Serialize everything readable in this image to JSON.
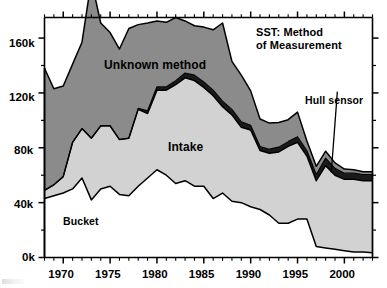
{
  "chart_data": {
    "type": "area",
    "stacked": true,
    "title_lines": [
      "SST: Method",
      "of Measurement"
    ],
    "xlabel": "",
    "ylabel": "",
    "xlim": [
      1968,
      2003
    ],
    "ylim": [
      0,
      175000
    ],
    "ytick_values": [
      0,
      40000,
      80000,
      120000,
      160000
    ],
    "ytick_labels": [
      "0k",
      "40k",
      "80k",
      "120k",
      "160k"
    ],
    "yminor_step": 20000,
    "xtick_values": [
      1970,
      1975,
      1980,
      1985,
      1990,
      1995,
      2000
    ],
    "xtick_labels": [
      "1970",
      "1975",
      "1980",
      "1985",
      "1990",
      "1995",
      "2000"
    ],
    "xminor_step": 1,
    "grid": false,
    "legend_position": "inline-annotations",
    "annotations": [
      {
        "text": "Unknown method",
        "x": 1975.5,
        "y": 140000
      },
      {
        "text": "Intake",
        "x": 1982.5,
        "y": 78000
      },
      {
        "text": "Bucket",
        "x": 1971.0,
        "y": 28000
      },
      {
        "text": "Hull sensor",
        "x": 1999.0,
        "y": 118000,
        "leader_to_x": 1998.6,
        "leader_to_y": 62000
      }
    ],
    "colors": {
      "bucket": "#ffffff",
      "intake": "#d2d2d2",
      "hull_sensor": "#1a1a1a",
      "unknown_method": "#8b8b8b",
      "outline": "#000000",
      "axis": "#000000",
      "background": "#ffffff"
    },
    "x": [
      1968,
      1969,
      1970,
      1971,
      1972,
      1973,
      1974,
      1975,
      1976,
      1977,
      1978,
      1979,
      1980,
      1981,
      1982,
      1983,
      1984,
      1985,
      1986,
      1987,
      1988,
      1989,
      1990,
      1991,
      1992,
      1993,
      1994,
      1995,
      1996,
      1997,
      1998,
      1999,
      2000,
      2001,
      2002,
      2003
    ],
    "series": [
      {
        "name": "Bucket",
        "values": [
          43000,
          45000,
          47000,
          50000,
          58000,
          42000,
          50000,
          52000,
          46000,
          45000,
          52000,
          58000,
          64000,
          60000,
          54000,
          56000,
          52000,
          52000,
          43000,
          47000,
          41000,
          40000,
          37000,
          35000,
          31000,
          25000,
          25000,
          28000,
          28000,
          8000,
          7000,
          6000,
          5000,
          4000,
          4000,
          3500
        ]
      },
      {
        "name": "Intake",
        "values": [
          6000,
          8000,
          12000,
          34000,
          36000,
          45000,
          46000,
          44000,
          40000,
          42000,
          56000,
          47000,
          58000,
          62000,
          72000,
          75000,
          77000,
          72000,
          75000,
          63000,
          63000,
          55000,
          56000,
          43000,
          45000,
          52000,
          56000,
          56000,
          46000,
          48000,
          60000,
          54000,
          52000,
          53000,
          52000,
          52500
        ]
      },
      {
        "name": "Hull sensor",
        "values": [
          0,
          0,
          0,
          0,
          0,
          0,
          0,
          0,
          0,
          0,
          800,
          2000,
          2500,
          2500,
          3000,
          3500,
          4000,
          4000,
          4000,
          4000,
          4000,
          4000,
          3500,
          3000,
          3000,
          3500,
          3500,
          4000,
          4000,
          4500,
          5500,
          5000,
          4500,
          4500,
          4500,
          4500
        ]
      },
      {
        "name": "Unknown method",
        "values": [
          89000,
          70000,
          66000,
          57000,
          63000,
          115000,
          75000,
          68000,
          66000,
          80000,
          61000,
          64000,
          48000,
          47000,
          46000,
          38000,
          36000,
          40000,
          44000,
          57000,
          35000,
          34000,
          25000,
          20000,
          19000,
          18000,
          16000,
          18000,
          7000,
          6000,
          5000,
          4000,
          3000,
          2500,
          2000,
          2000
        ]
      }
    ]
  }
}
